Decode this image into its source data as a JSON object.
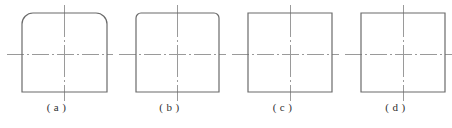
{
  "plate": {
    "width": 452,
    "height": 128,
    "background": "#ffffff",
    "outline_color": "#6b6b6b",
    "centerline_color": "#9a9a9a",
    "caption_color": "#2f2f2f"
  },
  "figures": [
    {
      "id": "figure-a",
      "caption": "( a )",
      "corner_style": "large-rounded-top",
      "corner_radius": 11,
      "box": {
        "x": 22,
        "y": 13,
        "width": 85,
        "height": 79
      },
      "vertical_centerline": {
        "x": 64,
        "y1": 5,
        "y2": 101
      },
      "horizontal_centerline": {
        "y": 54,
        "x1": 7,
        "x2": 113
      }
    },
    {
      "id": "figure-b",
      "caption": "( b )",
      "corner_style": "small-rounded-top",
      "corner_radius": 5,
      "box": {
        "x": 23,
        "y": 13,
        "width": 83,
        "height": 79
      },
      "vertical_centerline": {
        "x": 64,
        "y1": 5,
        "y2": 101
      },
      "horizontal_centerline": {
        "y": 54,
        "x1": 6,
        "x2": 113
      }
    },
    {
      "id": "figure-c",
      "caption": "( c )",
      "corner_style": "square",
      "corner_radius": 0,
      "box": {
        "x": 22,
        "y": 13,
        "width": 84,
        "height": 79
      },
      "vertical_centerline": {
        "x": 64,
        "y1": 5,
        "y2": 101
      },
      "horizontal_centerline": {
        "y": 54,
        "x1": 6,
        "x2": 113
      }
    },
    {
      "id": "figure-d",
      "caption": "( d )",
      "corner_style": "square",
      "corner_radius": 0,
      "box": {
        "x": 22,
        "y": 13,
        "width": 84,
        "height": 79
      },
      "vertical_centerline": {
        "x": 64,
        "y1": 5,
        "y2": 101
      },
      "horizontal_centerline": {
        "y": 54,
        "x1": 6,
        "x2": 113
      }
    }
  ]
}
